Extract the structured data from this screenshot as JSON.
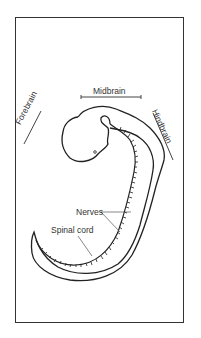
{
  "diagram": {
    "labels": {
      "midbrain": "Midbrain",
      "forebrain": "Forebrain",
      "hindbrain": "Hindbrain",
      "nerves": "Nerves",
      "spinal_cord": "Spinal cord"
    },
    "colors": {
      "stroke": "#222222",
      "label_line": "#555555",
      "background": "#ffffff",
      "frame": "#333333"
    }
  }
}
